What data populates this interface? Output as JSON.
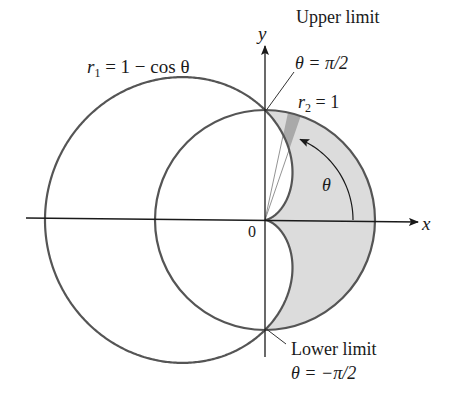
{
  "figure": {
    "type": "polar-area-diagram",
    "axes": {
      "x_label": "x",
      "y_label": "y",
      "origin_label": "0"
    },
    "curves": {
      "cardioid_label": "r₁ = 1 − cos θ",
      "cardioid_r": "r",
      "cardioid_sub": "1",
      "cardioid_rest": " = 1 − cos θ",
      "circle_r": "r",
      "circle_sub": "2",
      "circle_rest": " = 1"
    },
    "annotations": {
      "upper_limit_title": "Upper limit",
      "upper_limit_value": "θ = π/2",
      "lower_limit_title": "Lower limit",
      "lower_limit_value": "θ = −π/2",
      "theta_label": "θ"
    },
    "colors": {
      "curve": "#555555",
      "axis": "#1a1a1a",
      "shaded_region": "#dcdcdc",
      "sector_highlight": "#a9a9a9"
    },
    "geometry": {
      "origin_px": [
        265,
        220
      ],
      "unit_px": 110
    }
  }
}
